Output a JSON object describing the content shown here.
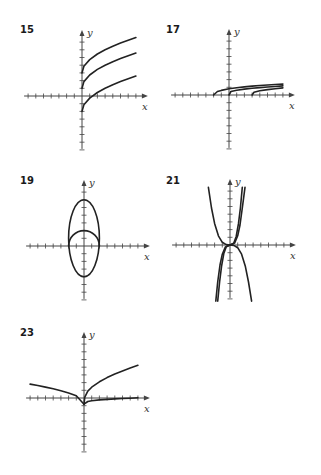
{
  "chart_data": [
    {
      "type": "line",
      "title": "15",
      "xlabel": "x",
      "ylabel": "y",
      "xlim": [
        -7,
        7
      ],
      "ylim": [
        -7,
        7
      ],
      "grid": false,
      "series": [
        {
          "name": "curve-1",
          "points": [
            [
              0,
              3
            ],
            [
              0.25,
              3.87
            ],
            [
              1,
              4.73
            ],
            [
              2,
              5.45
            ],
            [
              3,
              6.0
            ],
            [
              4,
              6.46
            ],
            [
              5,
              6.87
            ],
            [
              6,
              7.24
            ],
            [
              7,
              7.58
            ]
          ]
        },
        {
          "name": "curve-2",
          "points": [
            [
              0,
              1
            ],
            [
              0.25,
              1.87
            ],
            [
              1,
              2.73
            ],
            [
              2,
              3.45
            ],
            [
              3,
              4.0
            ],
            [
              4,
              4.46
            ],
            [
              5,
              4.87
            ],
            [
              6,
              5.24
            ],
            [
              7,
              5.58
            ]
          ]
        },
        {
          "name": "curve-3",
          "points": [
            [
              0,
              -2
            ],
            [
              0.25,
              -1.13
            ],
            [
              1,
              -0.27
            ],
            [
              2,
              0.45
            ],
            [
              3,
              1.0
            ],
            [
              4,
              1.46
            ],
            [
              5,
              1.87
            ],
            [
              6,
              2.24
            ],
            [
              7,
              2.58
            ]
          ]
        }
      ]
    },
    {
      "type": "line",
      "title": "17",
      "xlabel": "x",
      "ylabel": "y",
      "xlim": [
        -7,
        7
      ],
      "ylim": [
        -7,
        7
      ],
      "grid": false,
      "series": [
        {
          "name": "curve-1",
          "points": [
            [
              -2,
              0
            ],
            [
              -1.5,
              0.45
            ],
            [
              -1,
              0.6
            ],
            [
              0,
              0.8
            ],
            [
              1,
              0.95
            ],
            [
              2,
              1.05
            ],
            [
              3,
              1.15
            ],
            [
              4,
              1.23
            ],
            [
              5,
              1.3
            ],
            [
              6,
              1.36
            ],
            [
              7,
              1.42
            ]
          ]
        },
        {
          "name": "curve-2",
          "points": [
            [
              0,
              0
            ],
            [
              0.25,
              0.45
            ],
            [
              1,
              0.62
            ],
            [
              2,
              0.76
            ],
            [
              3,
              0.87
            ],
            [
              4,
              0.96
            ],
            [
              5,
              1.04
            ],
            [
              6,
              1.11
            ],
            [
              7,
              1.18
            ]
          ]
        },
        {
          "name": "curve-3",
          "points": [
            [
              3,
              0
            ],
            [
              3.25,
              0.35
            ],
            [
              4,
              0.55
            ],
            [
              5,
              0.7
            ],
            [
              6,
              0.82
            ],
            [
              7,
              0.92
            ]
          ]
        }
      ]
    },
    {
      "type": "line",
      "title": "19",
      "xlabel": "x",
      "ylabel": "y",
      "xlim": [
        -7,
        7
      ],
      "ylim": [
        -8,
        8
      ],
      "grid": false,
      "series": [
        {
          "name": "ellipse",
          "center": [
            0,
            1
          ],
          "radii": [
            2,
            5
          ]
        },
        {
          "name": "upper-semicircle",
          "center": [
            0,
            0
          ],
          "radius": 2,
          "half": "upper"
        }
      ]
    },
    {
      "type": "line",
      "title": "21",
      "xlabel": "x",
      "ylabel": "y",
      "xlim": [
        -7,
        7
      ],
      "ylim": [
        -8,
        8
      ],
      "grid": false,
      "series": [
        {
          "name": "curve-1",
          "points": [
            [
              -2.8,
              7.5
            ],
            [
              -2.4,
              4.8
            ],
            [
              -2,
              2.8
            ],
            [
              -1.5,
              1.2
            ],
            [
              -1,
              0.35
            ],
            [
              -0.5,
              0.05
            ],
            [
              0,
              0
            ],
            [
              0.5,
              -0.05
            ],
            [
              1,
              -0.35
            ],
            [
              1.5,
              -1.2
            ],
            [
              2,
              -2.8
            ],
            [
              2.4,
              -4.8
            ],
            [
              2.8,
              -7.3
            ]
          ]
        },
        {
          "name": "curve-2",
          "points": [
            [
              -1.85,
              -7.3
            ],
            [
              -1.6,
              -4.8
            ],
            [
              -1.3,
              -2.6
            ],
            [
              -1,
              -1.2
            ],
            [
              -0.6,
              -0.25
            ],
            [
              0,
              0
            ],
            [
              0.6,
              0.25
            ],
            [
              1,
              1.2
            ],
            [
              1.3,
              2.6
            ],
            [
              1.6,
              4.8
            ],
            [
              1.95,
              7.5
            ]
          ]
        },
        {
          "name": "curve-3",
          "points": [
            [
              -1.6,
              -7.3
            ],
            [
              -1.35,
              -4.8
            ],
            [
              -1.1,
              -2.8
            ],
            [
              -0.8,
              -1.1
            ],
            [
              -0.5,
              -0.25
            ],
            [
              0,
              0
            ],
            [
              0.5,
              0.25
            ],
            [
              0.8,
              1.1
            ],
            [
              1.1,
              2.8
            ],
            [
              1.35,
              4.8
            ],
            [
              1.6,
              7.5
            ]
          ]
        }
      ]
    },
    {
      "type": "line",
      "title": "23",
      "xlabel": "x",
      "ylabel": "y",
      "xlim": [
        -7,
        7
      ],
      "ylim": [
        -8,
        8
      ],
      "grid": false,
      "series": [
        {
          "name": "curve-left",
          "points": [
            [
              -7,
              1.8
            ],
            [
              -6,
              1.62
            ],
            [
              -5,
              1.42
            ],
            [
              -4,
              1.2
            ],
            [
              -3,
              0.95
            ],
            [
              -2,
              0.66
            ],
            [
              -1,
              0.28
            ],
            [
              0,
              -0.8
            ]
          ]
        },
        {
          "name": "curve-upper-right",
          "points": [
            [
              0,
              -0.8
            ],
            [
              0.1,
              0.1
            ],
            [
              0.5,
              0.9
            ],
            [
              1,
              1.4
            ],
            [
              2,
              2.1
            ],
            [
              3,
              2.65
            ],
            [
              4,
              3.1
            ],
            [
              5,
              3.5
            ],
            [
              6,
              3.9
            ],
            [
              7,
              4.25
            ]
          ]
        },
        {
          "name": "curve-lower-right",
          "points": [
            [
              0,
              -0.8
            ],
            [
              0.5,
              -0.45
            ],
            [
              1,
              -0.35
            ],
            [
              2,
              -0.25
            ],
            [
              3,
              -0.18
            ],
            [
              4,
              -0.12
            ],
            [
              5,
              -0.07
            ],
            [
              6,
              -0.02
            ],
            [
              7,
              0.02
            ]
          ]
        }
      ]
    }
  ]
}
